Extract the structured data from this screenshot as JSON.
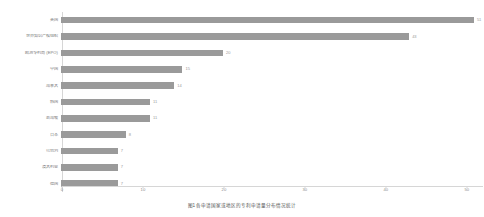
{
  "chart_data": {
    "type": "bar",
    "orientation": "horizontal",
    "title": "",
    "xlabel": "",
    "ylabel": "",
    "xlim": [
      0,
      52
    ],
    "xticks": [
      0,
      10,
      20,
      30,
      40,
      50
    ],
    "grid": false,
    "legend": "none",
    "bar_color": "#9a9a9a",
    "categories": [
      "美国",
      "世界知识产权组织",
      "欧洲专利局 (EPO)",
      "中国",
      "加拿大",
      "韩国",
      "新加坡",
      "日本",
      "以色列",
      "澳大利亚",
      "德国"
    ],
    "values": [
      51,
      43,
      20,
      15,
      14,
      11,
      11,
      8,
      7,
      7,
      7
    ]
  },
  "caption": {
    "text": "图1  各申请国家或地区的专利申请量分布情况统计"
  }
}
